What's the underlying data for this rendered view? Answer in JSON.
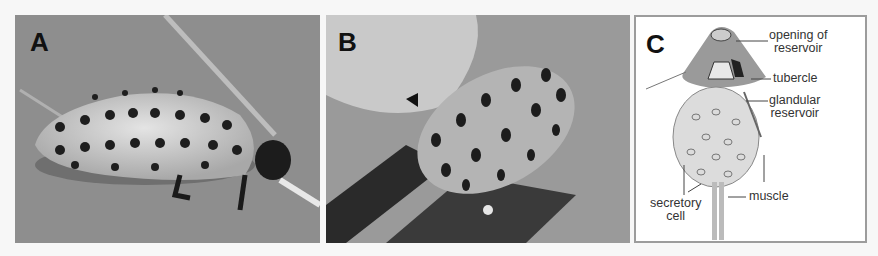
{
  "figure": {
    "panels": [
      {
        "label": "A",
        "description": "Larva with black spots on pale segmented body, side view on leaf"
      },
      {
        "label": "B",
        "description": "Larva from above with arrowhead marking secretion droplet at tubercle"
      },
      {
        "label": "C",
        "description": "Schematic diagram of defensive gland"
      }
    ],
    "diagram_labels": {
      "opening": "opening of",
      "opening2": "reservoir",
      "tubercle": "tubercle",
      "glandular": "glandular",
      "glandular2": "reservoir",
      "muscle": "muscle",
      "secretory": "secretory",
      "secretory2": "cell"
    }
  }
}
